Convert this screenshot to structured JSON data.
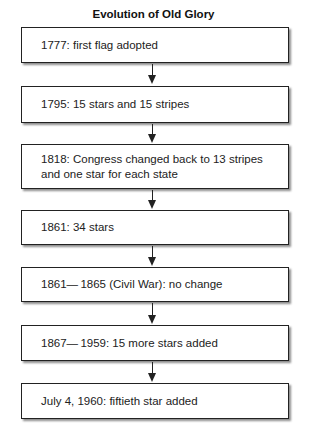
{
  "title": "Evolution of Old Glory",
  "steps": [
    {
      "text": "1777: first flag adopted"
    },
    {
      "text": "1795: 15 stars and 15 stripes"
    },
    {
      "text": "1818: Congress changed back to 13 stripes and one star for each state"
    },
    {
      "text": "1861: 34 stars"
    },
    {
      "text": "1861— 1865 (Civil War): no change"
    },
    {
      "text": "1867— 1959: 15 more stars added"
    },
    {
      "text": "July 4, 1960: fiftieth star added"
    }
  ],
  "connectors": [
    {
      "from": 0,
      "to": 1,
      "type": "arrow-down"
    },
    {
      "from": 1,
      "to": 2,
      "type": "arrow-down"
    },
    {
      "from": 2,
      "to": 3,
      "type": "arrow-down"
    },
    {
      "from": 3,
      "to": 4,
      "type": "arrow-down"
    },
    {
      "from": 4,
      "to": 5,
      "type": "arrow-down"
    },
    {
      "from": 5,
      "to": 6,
      "type": "arrow-down"
    }
  ]
}
